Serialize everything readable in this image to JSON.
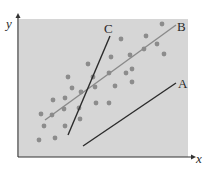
{
  "diagram": {
    "type": "scatter-with-lines",
    "axes": {
      "x_label": "x",
      "y_label": "y",
      "origin": [
        18,
        157
      ],
      "x_end": [
        196,
        157
      ],
      "y_end": [
        18,
        13
      ]
    },
    "plot_area": {
      "x": 19,
      "y": 19,
      "width": 169,
      "height": 138,
      "fill": "#d6d6d6"
    },
    "lines": [
      {
        "label": "A",
        "from": [
          83,
          146
        ],
        "to": [
          176,
          83
        ],
        "color": "#2b2b2b",
        "label_pos": [
          178,
          88
        ]
      },
      {
        "label": "B",
        "from": [
          45,
          120
        ],
        "to": [
          176,
          25
        ],
        "color": "#8a8a8a",
        "label_pos": [
          177,
          31
        ]
      },
      {
        "label": "C",
        "from": [
          68,
          135
        ],
        "to": [
          110,
          36
        ],
        "color": "#2b2b2b",
        "label_pos": [
          104,
          33
        ]
      }
    ],
    "points_color": "#8c8c8c",
    "points": [
      [
        162,
        24
      ],
      [
        121,
        39
      ],
      [
        146,
        36
      ],
      [
        111,
        57
      ],
      [
        130,
        55
      ],
      [
        157,
        44
      ],
      [
        144,
        49
      ],
      [
        164,
        54
      ],
      [
        88,
        64
      ],
      [
        68,
        77
      ],
      [
        93,
        77
      ],
      [
        109,
        73
      ],
      [
        126,
        73
      ],
      [
        132,
        69
      ],
      [
        72,
        88
      ],
      [
        81,
        92
      ],
      [
        95,
        87
      ],
      [
        115,
        86
      ],
      [
        132,
        82
      ],
      [
        53,
        100
      ],
      [
        65,
        98
      ],
      [
        96,
        103
      ],
      [
        109,
        103
      ],
      [
        41,
        114
      ],
      [
        52,
        115
      ],
      [
        64,
        109
      ],
      [
        79,
        108
      ],
      [
        44,
        126
      ],
      [
        65,
        126
      ],
      [
        80,
        119
      ],
      [
        39,
        140
      ],
      [
        55,
        138
      ]
    ]
  }
}
